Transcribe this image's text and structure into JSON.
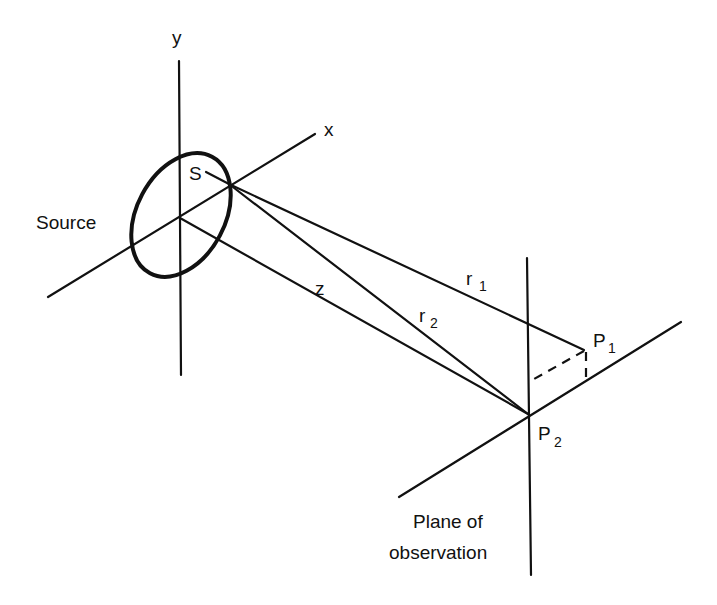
{
  "diagram": {
    "colors": {
      "ink": "#111111",
      "background": "#ffffff"
    },
    "source": {
      "label": "Source",
      "axis_y_label": "y",
      "axis_x_label": "x",
      "point_label": "S"
    },
    "rays": {
      "r1": {
        "letter": "r",
        "sub": "1"
      },
      "r2": {
        "letter": "r",
        "sub": "2"
      },
      "z": {
        "letter": "z"
      }
    },
    "observation": {
      "p1": {
        "letter": "P",
        "sub": "1"
      },
      "p2": {
        "letter": "P",
        "sub": "2"
      },
      "plane_label_line1": "Plane of",
      "plane_label_line2": "observation"
    }
  }
}
